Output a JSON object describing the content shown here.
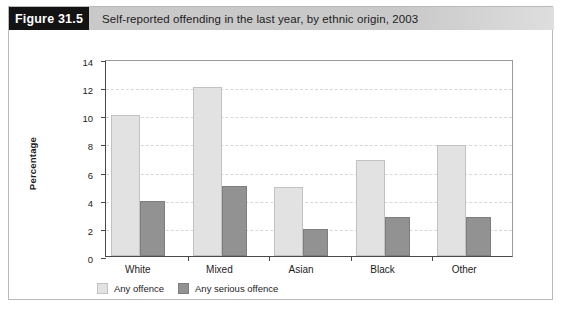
{
  "figure": {
    "number_label": "Figure 31.5",
    "title": "Self-reported offending in the last year, by ethnic origin, 2003"
  },
  "colors": {
    "figure_number_bg": "#131313",
    "header_band": "#c9c9c9",
    "series_any_offence": "#e2e2e2",
    "series_any_serious_offence": "#929292",
    "axis": "#4a4a4a",
    "gridline": "#d8d8d8"
  },
  "chart_data": {
    "type": "bar",
    "title": "Self-reported offending in the last year, by ethnic origin, 2003",
    "xlabel": "",
    "ylabel": "Percentage",
    "categories": [
      "White",
      "Mixed",
      "Asian",
      "Black",
      "Other"
    ],
    "series": [
      {
        "name": "Any offence",
        "values": [
          10.0,
          12.0,
          4.9,
          6.8,
          7.9
        ]
      },
      {
        "name": "Any serious offence",
        "values": [
          3.9,
          5.0,
          1.9,
          2.8,
          2.8
        ]
      }
    ],
    "ylim": [
      0,
      14
    ],
    "ytick_values": [
      0,
      2,
      4,
      6,
      8,
      10,
      12,
      14
    ],
    "ytick_labels": [
      "0",
      "2",
      "4",
      "6",
      "8",
      "10",
      "12",
      "14"
    ],
    "grid": true,
    "legend_position": "bottom-left"
  }
}
